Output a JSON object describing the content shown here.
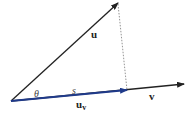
{
  "diagram": {
    "type": "vector-projection",
    "points": {
      "origin": [
        11,
        101
      ],
      "u_tip": [
        118,
        3
      ],
      "projection_foot": [
        127,
        90
      ],
      "v_tip": [
        184,
        84
      ]
    },
    "labels": {
      "u": "u",
      "theta": "θ",
      "s": "s",
      "u_v_base": "u",
      "u_v_sub": "v",
      "v": "v"
    },
    "colors": {
      "vector": "#222222",
      "projection": "#1f3a8a",
      "dotted": "#888888",
      "text": "#222222"
    }
  }
}
